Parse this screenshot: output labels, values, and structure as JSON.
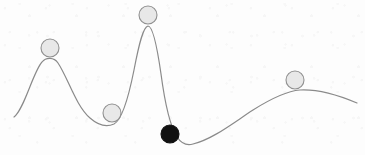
{
  "figure": {
    "kind": "energy-landscape-diagram",
    "width": 365,
    "height": 155,
    "background_color": "#fdfdfd",
    "caption": ""
  },
  "curve": {
    "name": "energy-landscape-curve",
    "stroke_color": "#8a8a8a",
    "stroke_width": 1.2,
    "fill": "none",
    "path": "M 14 117 C 24 110, 33 72, 42 62 C 46 57, 54 57, 58 63 C 68 78, 76 106, 90 118 C 99 126, 107 127, 114 124 C 122 120, 128 100, 134 70 C 139 44, 143 27, 148 26 C 153 26, 157 46, 161 74 C 165 104, 170 126, 177 137 C 181 143, 186 146, 193 144 C 213 139, 233 123, 253 110 C 272 98, 287 91, 300 90 C 318 89, 338 95, 357 103",
    "description": "Smooth one-dimensional potential-energy curve with two broad maxima, one tall narrow maximum, one shallow local minimum and one deep global minimum."
  },
  "features": [
    {
      "name": "local-maximum-left",
      "x": 50,
      "y": 58
    },
    {
      "name": "local-minimum-shallow",
      "x": 114,
      "y": 124
    },
    {
      "name": "global-maximum-narrow",
      "x": 148,
      "y": 26
    },
    {
      "name": "global-minimum-deep",
      "x": 185,
      "y": 145
    },
    {
      "name": "local-maximum-right",
      "x": 300,
      "y": 90
    }
  ],
  "balls": [
    {
      "id": "ball-1",
      "name": "ball-on-left-peak",
      "cx": 50,
      "cy": 48,
      "r": 9,
      "fill": "#e8e8e8",
      "stroke": "#909090",
      "stroke_width": 1.1,
      "state": "unstable-local-maximum",
      "label": ""
    },
    {
      "id": "ball-2",
      "name": "ball-in-shallow-valley",
      "cx": 112,
      "cy": 113,
      "r": 9,
      "fill": "#e8e8e8",
      "stroke": "#909090",
      "stroke_width": 1.1,
      "state": "metastable-local-minimum",
      "label": ""
    },
    {
      "id": "ball-3",
      "name": "ball-on-tall-peak",
      "cx": 148,
      "cy": 15,
      "r": 9,
      "fill": "#e8e8e8",
      "stroke": "#909090",
      "stroke_width": 1.1,
      "state": "unstable-global-maximum",
      "label": ""
    },
    {
      "id": "ball-4",
      "name": "ball-in-deep-valley",
      "cx": 170,
      "cy": 134,
      "r": 9,
      "fill": "#111111",
      "stroke": "#111111",
      "stroke_width": 1.1,
      "state": "stable-global-minimum",
      "label": ""
    },
    {
      "id": "ball-5",
      "name": "ball-on-right-hump",
      "cx": 295,
      "cy": 80,
      "r": 9,
      "fill": "#e8e8e8",
      "stroke": "#909090",
      "stroke_width": 1.1,
      "state": "unstable-local-maximum",
      "label": ""
    }
  ]
}
